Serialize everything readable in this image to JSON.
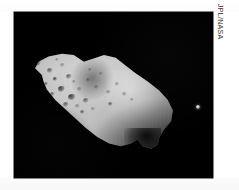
{
  "photo": {
    "background_color": "#000000",
    "page_color": "#ffffff",
    "subject": "asteroid-243-ida",
    "alt": "Asteroid 243 Ida with its moon Dactyl"
  },
  "credit": {
    "text": "JPL/NASA",
    "orientation": "vertical",
    "color": "#2b2b2b"
  },
  "objects": {
    "asteroid": {
      "name": "Ida",
      "label": "243 Ida"
    },
    "moon": {
      "name": "Dactyl",
      "label": "Dactyl"
    }
  },
  "craters": [
    {
      "x": 14,
      "y": 30,
      "w": 7,
      "h": 6,
      "style": "deep"
    },
    {
      "x": 22,
      "y": 22,
      "w": 5,
      "h": 4,
      "style": "shallow"
    },
    {
      "x": 27,
      "y": 38,
      "w": 6,
      "h": 5,
      "style": ""
    },
    {
      "x": 18,
      "y": 44,
      "w": 5,
      "h": 5,
      "style": "shallow"
    },
    {
      "x": 33,
      "y": 47,
      "w": 4,
      "h": 4,
      "style": "deep"
    },
    {
      "x": 40,
      "y": 33,
      "w": 5,
      "h": 4,
      "style": "shallow"
    },
    {
      "x": 46,
      "y": 44,
      "w": 6,
      "h": 5,
      "style": ""
    },
    {
      "x": 38,
      "y": 56,
      "w": 7,
      "h": 6,
      "style": "deep"
    },
    {
      "x": 30,
      "y": 62,
      "w": 5,
      "h": 4,
      "style": ""
    },
    {
      "x": 48,
      "y": 64,
      "w": 8,
      "h": 6,
      "style": "deep"
    },
    {
      "x": 57,
      "y": 57,
      "w": 5,
      "h": 4,
      "style": "shallow"
    },
    {
      "x": 43,
      "y": 72,
      "w": 6,
      "h": 5,
      "style": ""
    },
    {
      "x": 55,
      "y": 74,
      "w": 5,
      "h": 4,
      "style": "shallow"
    },
    {
      "x": 63,
      "y": 68,
      "w": 6,
      "h": 5,
      "style": ""
    },
    {
      "x": 66,
      "y": 48,
      "w": 4,
      "h": 4,
      "style": "shallow"
    },
    {
      "x": 74,
      "y": 55,
      "w": 5,
      "h": 4,
      "style": "shallow"
    },
    {
      "x": 79,
      "y": 42,
      "w": 4,
      "h": 3,
      "style": "shallow"
    },
    {
      "x": 86,
      "y": 60,
      "w": 5,
      "h": 4,
      "style": "shallow"
    },
    {
      "x": 95,
      "y": 52,
      "w": 4,
      "h": 4,
      "style": "shallow"
    },
    {
      "x": 102,
      "y": 62,
      "w": 5,
      "h": 4,
      "style": "shallow"
    },
    {
      "x": 60,
      "y": 80,
      "w": 5,
      "h": 4,
      "style": ""
    },
    {
      "x": 71,
      "y": 77,
      "w": 4,
      "h": 4,
      "style": "shallow"
    },
    {
      "x": 52,
      "y": 50,
      "w": 4,
      "h": 3,
      "style": "shallow"
    },
    {
      "x": 35,
      "y": 28,
      "w": 4,
      "h": 3,
      "style": "shallow"
    },
    {
      "x": 24,
      "y": 52,
      "w": 4,
      "h": 4,
      "style": ""
    },
    {
      "x": 88,
      "y": 72,
      "w": 5,
      "h": 4,
      "style": ""
    },
    {
      "x": 110,
      "y": 68,
      "w": 4,
      "h": 3,
      "style": "shallow"
    },
    {
      "x": 68,
      "y": 38,
      "w": 4,
      "h": 3,
      "style": "shallow"
    }
  ]
}
